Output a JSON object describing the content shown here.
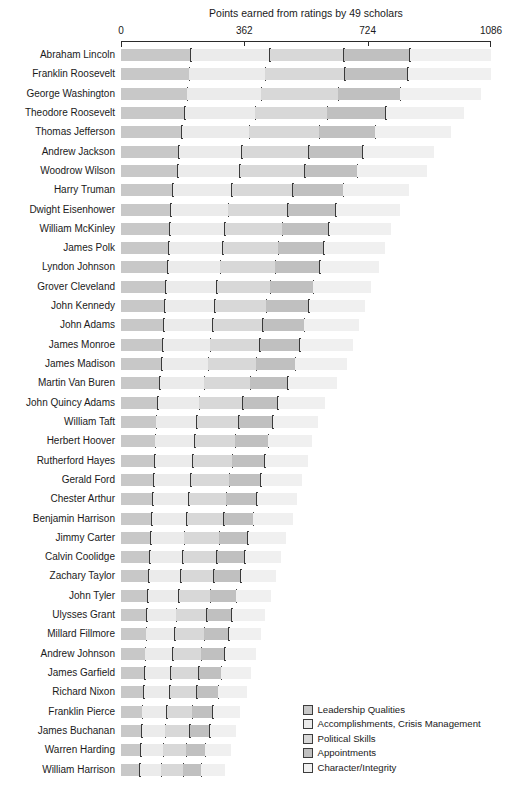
{
  "chart_data": {
    "type": "bar",
    "subtype": "horizontal-stacked",
    "title": "Points earned from ratings by 49 scholars",
    "xlabel": "",
    "ylabel": "",
    "xlim": [
      0,
      1086
    ],
    "xticks": [
      0,
      362,
      724,
      1086
    ],
    "xtick_labels": [
      "0",
      "362",
      "724",
      "1086"
    ],
    "grid": false,
    "legend_position": "bottom-right",
    "series": [
      {
        "name": "Leadership Qualities",
        "color": "#c8c8c8"
      },
      {
        "name": "Accomplishments, Crisis Management",
        "color": "#ebebeb"
      },
      {
        "name": "Political Skills",
        "color": "#d8d8d8"
      },
      {
        "name": "Appointments",
        "color": "#c0c0c0"
      },
      {
        "name": "Character/Integrity",
        "color": "#f0f0f0"
      }
    ],
    "categories": [
      "Abraham Lincoln",
      "Franklin Roosevelt",
      "George Washington",
      "Theodore Roosevelt",
      "Thomas Jefferson",
      "Andrew Jackson",
      "Woodrow Wilson",
      "Harry Truman",
      "Dwight Eisenhower",
      "William McKinley",
      "James Polk",
      "Lyndon Johnson",
      "Grover Cleveland",
      "John Kennedy",
      "John Adams",
      "James Monroe",
      "James Madison",
      "Martin Van Buren",
      "John Quincy Adams",
      "William Taft",
      "Herbert Hoover",
      "Rutherford Hayes",
      "Gerald Ford",
      "Chester Arthur",
      "Benjamin Harrison",
      "Jimmy Carter",
      "Calvin Coolidge",
      "Zachary Taylor",
      "John Tyler",
      "Ulysses Grant",
      "Millard Fillmore",
      "Andrew Johnson",
      "James Garfield",
      "Richard Nixon",
      "Franklin Pierce",
      "James Buchanan",
      "Warren Harding",
      "William Harrison"
    ],
    "values": [
      [
        205,
        232,
        217,
        194,
        238
      ],
      [
        200,
        223,
        234,
        185,
        244
      ],
      [
        194,
        218,
        226,
        182,
        238
      ],
      [
        188,
        206,
        212,
        172,
        229
      ],
      [
        179,
        198,
        205,
        165,
        221
      ],
      [
        170,
        185,
        196,
        158,
        209
      ],
      [
        166,
        183,
        190,
        155,
        203
      ],
      [
        152,
        173,
        180,
        147,
        194
      ],
      [
        147,
        168,
        174,
        141,
        188
      ],
      [
        143,
        162,
        168,
        137,
        182
      ],
      [
        140,
        158,
        164,
        134,
        178
      ],
      [
        137,
        155,
        161,
        131,
        174
      ],
      [
        132,
        150,
        156,
        127,
        169
      ],
      [
        129,
        146,
        152,
        124,
        164
      ],
      [
        126,
        143,
        148,
        121,
        160
      ],
      [
        123,
        139,
        145,
        118,
        156
      ],
      [
        120,
        136,
        141,
        115,
        152
      ],
      [
        114,
        130,
        135,
        110,
        146
      ],
      [
        108,
        122,
        127,
        104,
        138
      ],
      [
        104,
        118,
        123,
        100,
        133
      ],
      [
        101,
        115,
        119,
        97,
        129
      ],
      [
        99,
        112,
        116,
        95,
        126
      ],
      [
        96,
        109,
        113,
        92,
        122
      ],
      [
        93,
        106,
        110,
        90,
        119
      ],
      [
        91,
        103,
        107,
        87,
        116
      ],
      [
        87,
        99,
        103,
        84,
        111
      ],
      [
        85,
        96,
        100,
        82,
        108
      ],
      [
        82,
        93,
        97,
        79,
        105
      ],
      [
        79,
        90,
        93,
        76,
        101
      ],
      [
        76,
        86,
        90,
        73,
        97
      ],
      [
        74,
        84,
        87,
        71,
        94
      ],
      [
        71,
        81,
        84,
        68,
        91
      ],
      [
        69,
        78,
        81,
        66,
        88
      ],
      [
        67,
        76,
        79,
        64,
        85
      ],
      [
        63,
        72,
        74,
        61,
        80
      ],
      [
        61,
        69,
        72,
        58,
        77
      ],
      [
        58,
        66,
        68,
        56,
        74
      ],
      [
        55,
        63,
        65,
        53,
        70
      ]
    ]
  },
  "legend": {
    "items": [
      {
        "label": "Leadership Qualities"
      },
      {
        "label": "Accomplishments, Crisis Management"
      },
      {
        "label": "Political Skills"
      },
      {
        "label": "Appointments"
      },
      {
        "label": "Character/Integrity"
      }
    ]
  }
}
